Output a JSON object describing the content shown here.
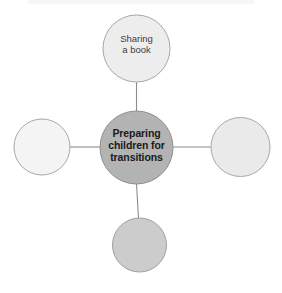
{
  "diagram": {
    "type": "mind-map",
    "background_color": "#ffffff",
    "connector_color": "#8c8c8c",
    "connector_width": 1,
    "top_band_color": "#f7f7f7",
    "center_node": {
      "id": "center",
      "label": "Preparing children for transitions",
      "label_lines": [
        "Preparing",
        "children for",
        "transitions"
      ],
      "fill": "#b3b3b3",
      "stroke": "#8f8f8f",
      "text_color": "#1a1a1a",
      "cx": 136.5,
      "cy": 147.5,
      "r": 36.5
    },
    "branch_nodes": [
      {
        "id": "branch-top",
        "position": "top",
        "label": "Sharing a book",
        "label_lines": [
          "Sharing",
          "a book"
        ],
        "fill": "#ededed",
        "stroke": "#a8a8a8",
        "text_color": "#3d3d3d",
        "cx": 136.5,
        "cy": 48.5,
        "r": 33.5
      },
      {
        "id": "branch-left",
        "position": "left",
        "label": "",
        "label_lines": [],
        "fill": "#f4f4f4",
        "stroke": "#a8a8a8",
        "text_color": "#3d3d3d",
        "cx": 42,
        "cy": 147,
        "r": 28
      },
      {
        "id": "branch-right",
        "position": "right",
        "label": "",
        "label_lines": [],
        "fill": "#eaeaea",
        "stroke": "#a8a8a8",
        "text_color": "#3d3d3d",
        "cx": 240.5,
        "cy": 147,
        "r": 29.5
      },
      {
        "id": "branch-bottom",
        "position": "bottom",
        "label": "",
        "label_lines": [],
        "fill": "#cccccc",
        "stroke": "#a0a0a0",
        "text_color": "#3d3d3d",
        "cx": 139.5,
        "cy": 245,
        "r": 27
      }
    ],
    "connectors": [
      {
        "id": "connector-top",
        "x1": 136.5,
        "y1": 82,
        "x2": 136.5,
        "y2": 111
      },
      {
        "id": "connector-left",
        "x1": 70,
        "y1": 147,
        "x2": 100,
        "y2": 147
      },
      {
        "id": "connector-right",
        "x1": 173,
        "y1": 147,
        "x2": 211,
        "y2": 147
      },
      {
        "id": "connector-bottom",
        "x1": 136.5,
        "y1": 184,
        "x2": 138.5,
        "y2": 218
      }
    ]
  }
}
